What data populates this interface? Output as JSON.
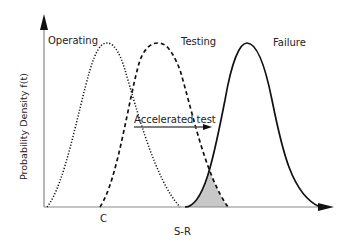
{
  "diagram": {
    "y_axis_label": "Probability Density f(t)",
    "x_axis_label": "S-R",
    "x_marker_label": "C",
    "curves": [
      {
        "name": "Operating",
        "style": "dotted"
      },
      {
        "name": "Testing",
        "style": "dashed"
      },
      {
        "name": "Failure",
        "style": "solid"
      }
    ],
    "arrow_label": "Accelerated test",
    "colors": {
      "axis": "#888888",
      "curve": "#111111",
      "overlap_fill": "#c8c8c8"
    }
  }
}
